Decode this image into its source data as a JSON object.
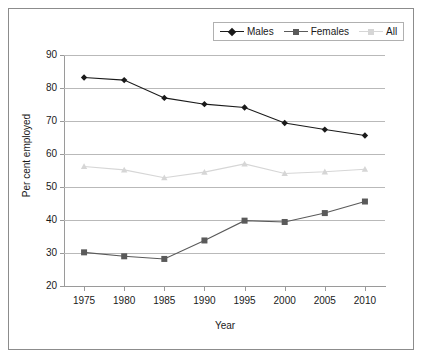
{
  "chart_data": {
    "type": "line",
    "title": "",
    "xlabel": "Year",
    "ylabel": "Per cent employed",
    "categories": [
      1975,
      1980,
      1985,
      1990,
      1995,
      2000,
      2005,
      2010
    ],
    "xtick_labels": [
      "1975",
      "1980",
      "1985",
      "1990",
      "1995",
      "2000",
      "2005",
      "2010"
    ],
    "ytick_labels": [
      "90",
      "80",
      "70",
      "60",
      "50",
      "40",
      "30",
      "20"
    ],
    "ylim": [
      20,
      90
    ],
    "ytick_step": 10,
    "xlim": [
      1975,
      2010
    ],
    "grid": true,
    "legend_position": "top-right",
    "series": [
      {
        "name": "Males",
        "color": "#1a1a1a",
        "marker": "diamond",
        "values": [
          83.2,
          82.4,
          77.0,
          75.1,
          74.1,
          69.4,
          67.4,
          65.6
        ]
      },
      {
        "name": "Females",
        "color": "#5a5a5a",
        "marker": "square",
        "values": [
          30.2,
          29.0,
          28.2,
          33.8,
          39.8,
          39.4,
          42.1,
          45.6
        ]
      },
      {
        "name": "All",
        "color": "#d6d6d6",
        "marker": "triangle",
        "values": [
          56.2,
          55.2,
          52.8,
          54.5,
          57.0,
          54.1,
          54.6,
          55.4
        ]
      }
    ]
  },
  "legend": {
    "items": [
      {
        "label": "Males"
      },
      {
        "label": "Females"
      },
      {
        "label": "All"
      }
    ]
  },
  "axes": {
    "x_title": "Year",
    "y_title": "Per cent employed"
  }
}
